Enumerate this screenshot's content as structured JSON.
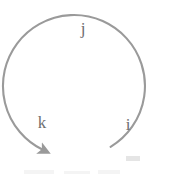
{
  "figure": {
    "type": "arc-diagram",
    "background_color": "#ffffff",
    "stroke_color": "#9a9a9a",
    "label_color": "#6e6e6e",
    "stroke_width": 2.1,
    "arc": {
      "center_x": 84,
      "center_y": 81,
      "radius": 71,
      "start_angle_deg": 69,
      "end_angle_deg": 292,
      "direction": "counterclockwise",
      "open_gap_at": "bottom",
      "arrow_end": "lower-left",
      "arrow_tip_x": 42,
      "arrow_tip_y": 156,
      "tail_end_x": 131,
      "tail_end_y": 157
    },
    "labels": [
      {
        "id": "j",
        "text": "j",
        "position": "top",
        "x": 83,
        "y": 30
      },
      {
        "id": "k",
        "text": "k",
        "position": "lower-left",
        "x": 42,
        "y": 124
      },
      {
        "id": "i",
        "text": "i",
        "position": "lower-right",
        "x": 128,
        "y": 126
      }
    ]
  }
}
